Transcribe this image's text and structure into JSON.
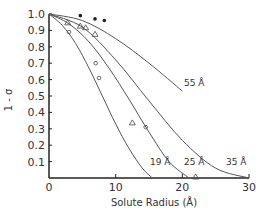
{
  "chart_data": {
    "type": "line",
    "title": "",
    "xlabel": "Solute Radius (Å)",
    "ylabel": "1 - σ",
    "xlim": [
      0,
      30
    ],
    "ylim": [
      0,
      1.0
    ],
    "x_ticks": [
      "0",
      "10",
      "20",
      "30"
    ],
    "y_ticks": [
      "0.1",
      "0.2",
      "0.3",
      "0.4",
      "0.5",
      "0.6",
      "0.7",
      "0.8",
      "0.9",
      "1.0"
    ],
    "grid": false,
    "series": [
      {
        "name": "19 Å",
        "label": "19 Å",
        "x": [
          0,
          2,
          4,
          6,
          8,
          10,
          12,
          14,
          15.5
        ],
        "y": [
          1.0,
          0.93,
          0.82,
          0.67,
          0.5,
          0.33,
          0.18,
          0.06,
          0.0
        ]
      },
      {
        "name": "25 Å",
        "label": "25 Å",
        "x": [
          0,
          3,
          6,
          9,
          12,
          15,
          18,
          21
        ],
        "y": [
          1.0,
          0.94,
          0.83,
          0.67,
          0.48,
          0.28,
          0.1,
          0.0
        ]
      },
      {
        "name": "35 Å",
        "label": "35 Å",
        "x": [
          0,
          5,
          10,
          15,
          20,
          25,
          30
        ],
        "y": [
          1.0,
          0.92,
          0.72,
          0.47,
          0.23,
          0.06,
          0.0
        ]
      },
      {
        "name": "55 Å",
        "label": "55 Å",
        "x": [
          0,
          5,
          10,
          15,
          20
        ],
        "y": [
          1.0,
          0.96,
          0.85,
          0.7,
          0.53
        ]
      }
    ],
    "points": {
      "filled_circles": {
        "x": [
          4.7,
          6.9,
          8.3
        ],
        "y": [
          0.99,
          0.97,
          0.96
        ]
      },
      "triangles": {
        "x": [
          2.8,
          4.7,
          5.5,
          6.9,
          12.5,
          22.0
        ],
        "y": [
          0.94,
          0.92,
          0.91,
          0.87,
          0.33,
          0.0
        ]
      },
      "open_circles": {
        "x": [
          3.0,
          7.0,
          7.5,
          14.5
        ],
        "y": [
          0.89,
          0.7,
          0.61,
          0.31
        ]
      }
    }
  },
  "axes": {
    "x_title": "Solute Radius (Å)",
    "y_title": "1 - σ"
  }
}
